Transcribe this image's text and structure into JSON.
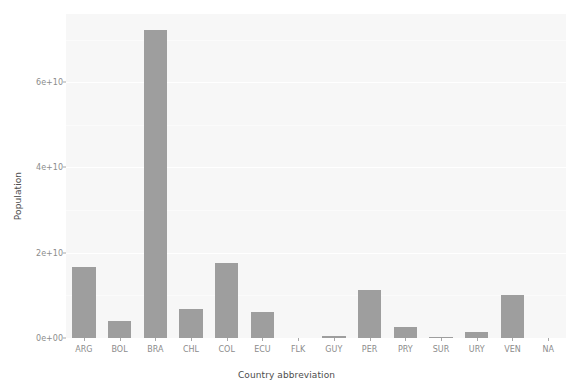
{
  "chart_data": {
    "type": "bar",
    "title": "",
    "subtitle": "",
    "xlabel": "Country abbreviation",
    "ylabel": "Population",
    "categories": [
      "ARG",
      "BOL",
      "BRA",
      "CHL",
      "COL",
      "ECU",
      "FLK",
      "GUY",
      "PER",
      "PRY",
      "SUR",
      "URY",
      "VEN",
      "NA"
    ],
    "values": [
      16600000000,
      4000000000,
      72200000000,
      6700000000,
      17600000000,
      6000000000,
      0,
      400000000,
      11200000000,
      2700000000,
      150000000,
      1300000000,
      10200000000,
      0
    ],
    "ylim": [
      0,
      76000000000
    ],
    "ytick_values": [
      0,
      20000000000,
      40000000000,
      60000000000
    ],
    "ytick_labels": [
      "0e+00",
      "2e+10",
      "4e+10",
      "6e+10"
    ],
    "grid": true,
    "legend": "none",
    "bar_color": "#9e9e9e",
    "panel_color": "#f7f7f7",
    "grid_color": "#ffffff",
    "axis_text_color": "#8c8c8c",
    "axis_title_color": "#4d4d4d"
  },
  "axis": {
    "y_title": "Population",
    "x_title": "Country abbreviation",
    "y_ticks": [
      {
        "label": "0e+00",
        "value": 0
      },
      {
        "label": "2e+10",
        "value": 20000000000
      },
      {
        "label": "4e+10",
        "value": 40000000000
      },
      {
        "label": "6e+10",
        "value": 60000000000
      }
    ],
    "x_ticks": [
      {
        "label": "ARG"
      },
      {
        "label": "BOL"
      },
      {
        "label": "BRA"
      },
      {
        "label": "CHL"
      },
      {
        "label": "COL"
      },
      {
        "label": "ECU"
      },
      {
        "label": "FLK"
      },
      {
        "label": "GUY"
      },
      {
        "label": "PER"
      },
      {
        "label": "PRY"
      },
      {
        "label": "SUR"
      },
      {
        "label": "URY"
      },
      {
        "label": "VEN"
      },
      {
        "label": "NA"
      }
    ]
  }
}
